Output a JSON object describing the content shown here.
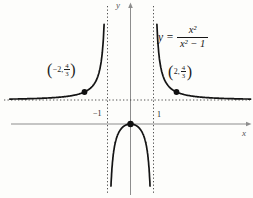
{
  "labels": {
    "y_axis": "y",
    "x_axis": "x"
  },
  "equation": {
    "lhs": "y",
    "equals": "=",
    "numerator": "x²",
    "denominator": "x² − 1"
  },
  "points": {
    "left": {
      "open": "(",
      "coord": "−2,",
      "frac_num": "4",
      "frac_den": "3",
      "close": ")"
    },
    "right": {
      "open": "(",
      "coord": "2,",
      "frac_num": "4",
      "frac_den": "3",
      "close": ")"
    }
  },
  "chart_data": {
    "type": "line",
    "equation": "y = x^2/(x^2 - 1)",
    "numerator_coeffs": [
      1,
      0,
      0
    ],
    "denominator_coeffs": [
      1,
      0,
      -1
    ],
    "asymptotes": {
      "vertical_x": [
        -1,
        1
      ],
      "horizontal_y": 1
    },
    "x_ticks": [
      -1,
      1
    ],
    "x_tick_labels": [
      "−1",
      "1"
    ],
    "axis_labels": {
      "x": "x",
      "y": "y"
    },
    "labeled_points": [
      {
        "x": -2,
        "y": 1.3333,
        "label": "(−2, 4/3)"
      },
      {
        "x": 2,
        "y": 1.3333,
        "label": "(2, 4/3)"
      },
      {
        "x": 0,
        "y": 0,
        "label": "origin"
      }
    ],
    "branches": [
      {
        "name": "left",
        "x_range": [
          -5.25,
          -1.1
        ]
      },
      {
        "name": "middle",
        "x_range": [
          -0.92,
          0.92
        ]
      },
      {
        "name": "right",
        "x_range": [
          1.1,
          5.22
        ]
      }
    ],
    "x_visible_range": [
      -5.3,
      5.3
    ],
    "y_visible_range": [
      -3.2,
      4.3
    ],
    "grid": false,
    "style": {
      "curve_color": "#141414",
      "axis_color": "#8d8d8d",
      "asymptote_color": "#3c3c3c",
      "point_color": "#111111"
    }
  }
}
